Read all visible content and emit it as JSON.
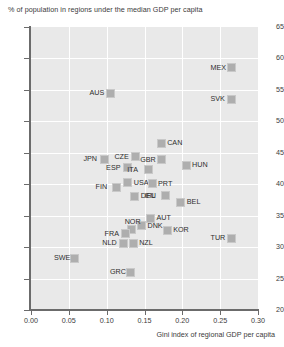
{
  "chart_data": {
    "type": "scatter",
    "title": "% of population in regions under the median GDP per capita",
    "ylabel": "% of population in regions under the median GDP per capita",
    "xlabel": "Gini index of  regional GDP per capita",
    "xlim": [
      0.0,
      0.3
    ],
    "ylim": [
      20,
      65
    ],
    "xticks": [
      "0.00",
      "0.05",
      "0.10",
      "0.15",
      "0.20",
      "0.25",
      "0.30"
    ],
    "xtick_values": [
      0.0,
      0.05,
      0.1,
      0.15,
      0.2,
      0.25,
      0.3
    ],
    "yticks": [
      "20",
      "25",
      "30",
      "35",
      "40",
      "45",
      "50",
      "55",
      "60",
      "65"
    ],
    "ytick_values": [
      20,
      25,
      30,
      35,
      40,
      45,
      50,
      55,
      60,
      65
    ],
    "grid": true,
    "legend": "none",
    "marker_color": "#aeaeae",
    "plot_background": "#e9e9e9",
    "points": [
      {
        "label": "MEX",
        "x": 0.265,
        "y": 58.5,
        "label_pos": "left"
      },
      {
        "label": "SVK",
        "x": 0.265,
        "y": 53.5,
        "label_pos": "left"
      },
      {
        "label": "AUS",
        "x": 0.105,
        "y": 54.5,
        "label_pos": "left"
      },
      {
        "label": "CAN",
        "x": 0.172,
        "y": 46.5,
        "label_pos": "right"
      },
      {
        "label": "CZE",
        "x": 0.138,
        "y": 44.4,
        "label_pos": "left"
      },
      {
        "label": "GBR",
        "x": 0.172,
        "y": 43.9,
        "label_pos": "left"
      },
      {
        "label": "HUN",
        "x": 0.205,
        "y": 43.0,
        "label_pos": "right"
      },
      {
        "label": "JPN",
        "x": 0.097,
        "y": 44.0,
        "label_pos": "left"
      },
      {
        "label": "ESP",
        "x": 0.127,
        "y": 42.6,
        "label_pos": "left"
      },
      {
        "label": "ITA",
        "x": 0.155,
        "y": 42.3,
        "label_pos": "left"
      },
      {
        "label": "USA",
        "x": 0.128,
        "y": 40.2,
        "label_pos": "right"
      },
      {
        "label": "FIN",
        "x": 0.113,
        "y": 39.5,
        "label_pos": "left"
      },
      {
        "label": "PRT",
        "x": 0.16,
        "y": 40.1,
        "label_pos": "right"
      },
      {
        "label": "IRL",
        "x": 0.178,
        "y": 38.2,
        "label_pos": "left"
      },
      {
        "label": "DEU",
        "x": 0.137,
        "y": 38.1,
        "label_pos": "right"
      },
      {
        "label": "BEL",
        "x": 0.198,
        "y": 37.1,
        "label_pos": "right"
      },
      {
        "label": "AUT",
        "x": 0.158,
        "y": 34.6,
        "label_pos": "right"
      },
      {
        "label": "DNK",
        "x": 0.146,
        "y": 33.4,
        "label_pos": "right"
      },
      {
        "label": "NOR",
        "x": 0.133,
        "y": 32.8,
        "label_pos": "top"
      },
      {
        "label": "KOR",
        "x": 0.18,
        "y": 32.7,
        "label_pos": "right"
      },
      {
        "label": "TUR",
        "x": 0.265,
        "y": 31.4,
        "label_pos": "left"
      },
      {
        "label": "FRA",
        "x": 0.125,
        "y": 32.1,
        "label_pos": "left"
      },
      {
        "label": "NLD",
        "x": 0.122,
        "y": 30.6,
        "label_pos": "left"
      },
      {
        "label": "NZL",
        "x": 0.135,
        "y": 30.6,
        "label_pos": "right"
      },
      {
        "label": "SWE",
        "x": 0.058,
        "y": 28.2,
        "label_pos": "left"
      },
      {
        "label": "GRC",
        "x": 0.132,
        "y": 26.0,
        "label_pos": "left"
      }
    ]
  }
}
